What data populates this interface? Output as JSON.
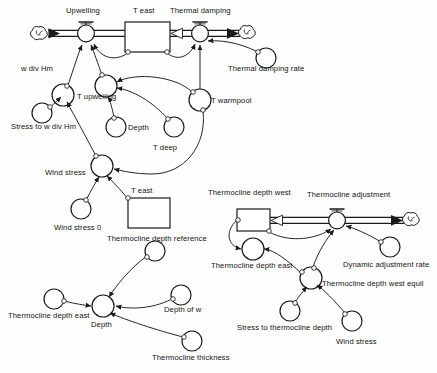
{
  "diagram": {
    "type": "system-dynamics-stock-flow",
    "stroke_color": "#1a1a1a",
    "background_color": "#ffffff",
    "stocks": [
      {
        "id": "t_east_top",
        "label": "T east",
        "x": 125,
        "y": 22,
        "w": 45,
        "h": 30,
        "label_x": 132,
        "label_y": 11
      },
      {
        "id": "t_east_lower",
        "label": "T east",
        "x": 128,
        "y": 198,
        "w": 42,
        "h": 30,
        "label_x": 135,
        "label_y": 188
      },
      {
        "id": "thermocline_depth_west",
        "label": "Thermocline depth west",
        "x": 237,
        "y": 209,
        "w": 33,
        "h": 22,
        "label_x": 209,
        "label_y": 193
      }
    ],
    "flows": [
      {
        "id": "upwelling",
        "label": "Upwelling",
        "cx": 86,
        "cy": 33,
        "label_x": 66,
        "label_y": 11
      },
      {
        "id": "thermal_damping",
        "label": "Thermal damping",
        "cx": 200,
        "cy": 33,
        "label_x": 170,
        "label_y": 11
      },
      {
        "id": "thermocline_adjustment",
        "label": "Thermocline adjustment",
        "cx": 337,
        "cy": 220,
        "label_x": 308,
        "label_y": 194
      }
    ],
    "clouds": [
      {
        "id": "cloud-upwelling-source",
        "cx": 39,
        "cy": 34
      },
      {
        "id": "cloud-thermal-damping-sink",
        "cx": 247,
        "cy": 33
      },
      {
        "id": "cloud-thermocline-sink",
        "cx": 411,
        "cy": 220
      }
    ],
    "variables": [
      {
        "id": "w_div_hm",
        "label": "w div Hm",
        "cx": 63,
        "cy": 95,
        "r": 11,
        "label_x": 21,
        "label_y": 66
      },
      {
        "id": "stress_to_w_div_hm",
        "label": "Stress to w div Hm",
        "cx": 42,
        "cy": 113,
        "r": 10,
        "label_x": 12,
        "label_y": 128
      },
      {
        "id": "t_upwelling",
        "label": "T upwelling",
        "cx": 106,
        "cy": 86,
        "r": 11,
        "label_x": 76,
        "label_y": 95
      },
      {
        "id": "depth_upper",
        "label": "Depth",
        "cx": 116,
        "cy": 127,
        "r": 10,
        "label_x": 126,
        "label_y": 126
      },
      {
        "id": "t_deep",
        "label": "T deep",
        "cx": 174,
        "cy": 127,
        "r": 10,
        "label_x": 152,
        "label_y": 146
      },
      {
        "id": "t_warmpool",
        "label": "T warmpool",
        "cx": 200,
        "cy": 100,
        "r": 11,
        "label_x": 211,
        "label_y": 96
      },
      {
        "id": "thermal_damping_rate",
        "label": "Thermal damping rate",
        "cx": 266,
        "cy": 58,
        "r": 10,
        "label_x": 228,
        "label_y": 68
      },
      {
        "id": "wind_stress_main",
        "label": "Wind stress",
        "cx": 102,
        "cy": 166,
        "r": 11,
        "label_x": 44,
        "label_y": 170
      },
      {
        "id": "wind_stress_0",
        "label": "Wind stress 0",
        "cx": 81,
        "cy": 209,
        "r": 10,
        "label_x": 52,
        "label_y": 226
      },
      {
        "id": "thermocline_depth_reference",
        "label": "Thermocline depth reference",
        "cx": 155,
        "cy": 251,
        "r": 10,
        "label_x": 107,
        "label_y": 236
      },
      {
        "id": "depth_of_w",
        "label": "Depth of w",
        "cx": 181,
        "cy": 295,
        "r": 10,
        "label_x": 165,
        "label_y": 307
      },
      {
        "id": "depth_lower",
        "label": "Depth",
        "cx": 103,
        "cy": 306,
        "r": 11,
        "label_x": 92,
        "label_y": 322
      },
      {
        "id": "thermocline_depth_east_lower",
        "label": "Thermocline depth east",
        "cx": 54,
        "cy": 299,
        "r": 10,
        "label_x": 10,
        "label_y": 313
      },
      {
        "id": "thermocline_thickness",
        "label": "Thermocline thickness",
        "cx": 192,
        "cy": 341,
        "r": 10,
        "label_x": 152,
        "label_y": 355
      },
      {
        "id": "thermocline_depth_east",
        "label": "Thermocline depth east",
        "cx": 253,
        "cy": 249,
        "r": 11,
        "label_x": 212,
        "label_y": 264
      },
      {
        "id": "thermocline_depth_west_equil",
        "label": "Thermocline depth west equil",
        "cx": 311,
        "cy": 278,
        "r": 11,
        "label_x": 322,
        "label_y": 280
      },
      {
        "id": "dynamic_adjustment_rate",
        "label": "Dynamic adjustment rate",
        "cx": 390,
        "cy": 247,
        "r": 10,
        "label_x": 344,
        "label_y": 261
      },
      {
        "id": "stress_to_thermocline_depth",
        "label": "Stress to thermocline depth",
        "cx": 290,
        "cy": 311,
        "r": 10,
        "label_x": 238,
        "label_y": 325
      },
      {
        "id": "wind_stress_lower",
        "label": "Wind stress",
        "cx": 352,
        "cy": 321,
        "r": 10,
        "label_x": 337,
        "label_y": 339
      }
    ]
  }
}
